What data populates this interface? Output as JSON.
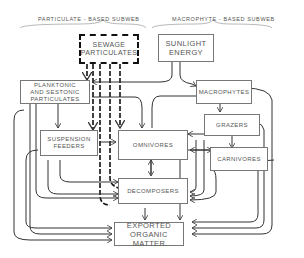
{
  "subwebs": {
    "left": "PARTICULATE - BASED SUBWEB",
    "right": "MACROPHYTE - BASED SUBWEB"
  },
  "nodes": {
    "sewage": "SEWAGE\nPARTICULATES",
    "sunlight": "SUNLIGHT\nENERGY",
    "planktonic": "PLANKTONIC\nAND SESTONIC\nPARTICULATES",
    "macrophytes": "MACROPHYTES",
    "grazers": "GRAZERS",
    "suspension": "SUSPENSION\nFEEDERS",
    "omnivores": "OMNIVORES",
    "carnivores": "CARNIVORES",
    "decomposers": "DECOMPOSERS",
    "exported": "EXPORTED\nORGANIC MATTER"
  }
}
